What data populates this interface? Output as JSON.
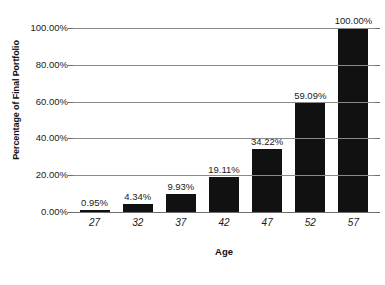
{
  "chart_data": {
    "type": "bar",
    "title": "",
    "xlabel": "Age",
    "ylabel": "Percentage of Final Portfolio",
    "categories": [
      "27",
      "32",
      "37",
      "42",
      "47",
      "52",
      "57"
    ],
    "values": [
      0.95,
      4.34,
      9.93,
      19.11,
      34.22,
      59.09,
      100.0
    ],
    "value_labels": [
      "0.95%",
      "4.34%",
      "9.93%",
      "19.11%",
      "34.22%",
      "59.09%",
      "100.00%"
    ],
    "ylim": [
      0,
      100
    ],
    "ytick_values": [
      0,
      20,
      40,
      60,
      80,
      100
    ],
    "ytick_labels": [
      "0.00%",
      "20.00%",
      "40.00%",
      "60.00%",
      "80.00%",
      "100.00%"
    ],
    "grid": true,
    "legend": null,
    "legend_position": "none",
    "bar_color": "#111111",
    "grid_color": "#8a8a8a",
    "background_color": "#ffffff",
    "text_color": "#1a1a1a"
  }
}
